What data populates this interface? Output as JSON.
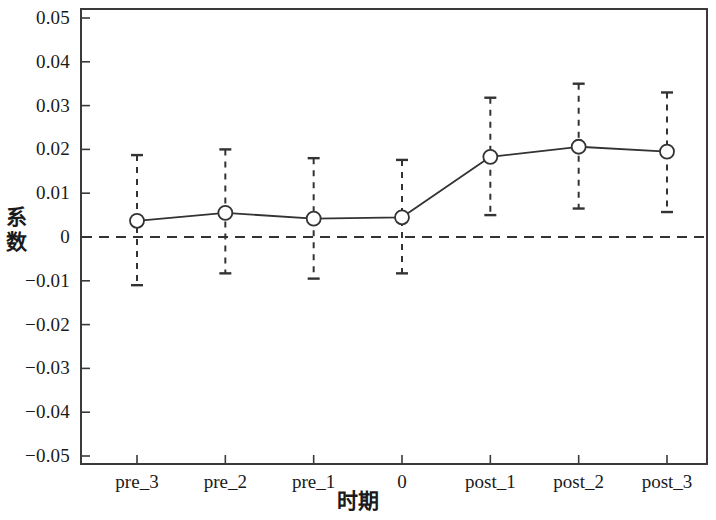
{
  "chart_data": {
    "type": "line",
    "title": "",
    "subtitle": "",
    "xlabel": "时期",
    "ylabel": "系数",
    "categories": [
      "pre_3",
      "pre_2",
      "pre_1",
      "0",
      "post_1",
      "post_2",
      "post_3"
    ],
    "values": [
      0.0037,
      0.0055,
      0.0042,
      0.0045,
      0.0183,
      0.0206,
      0.0195
    ],
    "error_bars": {
      "lower": [
        -0.011,
        -0.0083,
        -0.0095,
        -0.0083,
        0.005,
        0.0065,
        0.0057
      ],
      "upper": [
        0.0187,
        0.02,
        0.018,
        0.0176,
        0.0318,
        0.035,
        0.033
      ]
    },
    "series": [
      {
        "name": "系数",
        "values": [
          0.0037,
          0.0055,
          0.0042,
          0.0045,
          0.0183,
          0.0206,
          0.0195
        ]
      }
    ],
    "ylim": [
      -0.05,
      0.05
    ],
    "yticks": [
      0.05,
      0.04,
      0.03,
      0.02,
      0.01,
      0,
      -0.01,
      -0.02,
      -0.03,
      -0.04,
      -0.05
    ],
    "ytick_labels": [
      "0.05",
      "0.04",
      "0.03",
      "0.02",
      "0.01",
      "0",
      "−0.01",
      "−0.02",
      "−0.03",
      "−0.04",
      "−0.05"
    ],
    "grid": false,
    "legend": null,
    "reference_line": {
      "value": 0,
      "style": "dashed",
      "orientation": "horizontal"
    },
    "marker": "circle-open",
    "line_style": "solid",
    "errorbar_style": "dashed",
    "colors": {
      "line": "#333333",
      "marker": "#333333",
      "errorbar": "#333333",
      "axis": "#3a3a3a",
      "reference_line": "#333333",
      "background": "#ffffff"
    }
  },
  "axis": {
    "y_title": "系数",
    "y_title_chars": [
      "系",
      "数"
    ],
    "x_title": "时期"
  }
}
